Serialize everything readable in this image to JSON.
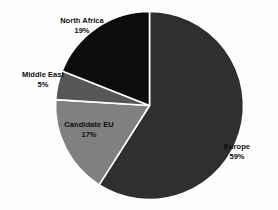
{
  "chart_data": {
    "type": "pie",
    "title": "",
    "subtitle": "",
    "xlabel": "",
    "ylabel": "",
    "legend_position": "none",
    "grid": false,
    "start_angle_deg": 0,
    "direction": "clockwise",
    "categories": [
      "Europe",
      "Candidate EU",
      "Middle East",
      "North Africa"
    ],
    "values": [
      59,
      17,
      5,
      19
    ],
    "value_unit": "%",
    "labels": [
      "Europe",
      "Candidate EU",
      "Middle East",
      "North Africa"
    ],
    "value_labels": [
      "59%",
      "17%",
      "5%",
      "19%"
    ],
    "colors": [
      "#2f2f2f",
      "#808080",
      "#565656",
      "#0c0c0c"
    ],
    "slices": [
      {
        "name": "Europe",
        "value": 59,
        "value_label": "59%",
        "color": "#2f2f2f"
      },
      {
        "name": "Candidate EU",
        "value": 17,
        "value_label": "17%",
        "color": "#808080"
      },
      {
        "name": "Middle East",
        "value": 5,
        "value_label": "5%",
        "color": "#565656"
      },
      {
        "name": "North Africa",
        "value": 19,
        "value_label": "19%",
        "color": "#0c0c0c"
      }
    ],
    "total": 100,
    "separator_color": "#ffffff",
    "background_color": "#fdfdfd",
    "label_text_color": "#0d0d0d"
  },
  "labels": {
    "north_africa": {
      "name": "North Africa",
      "percent": "19%"
    },
    "middle_east": {
      "name": "Middle East",
      "percent": "5%"
    },
    "candidate_eu": {
      "name": "Candidate EU",
      "percent": "17%"
    },
    "europe": {
      "name": "Europe",
      "percent": "59%"
    }
  }
}
